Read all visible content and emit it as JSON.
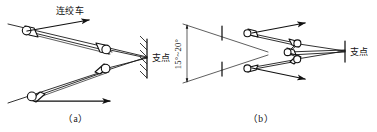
{
  "figure": {
    "background_color": "#ffffff",
    "line_color": "#1a1a1a",
    "width": 377,
    "height": 132
  },
  "labels": {
    "winch": "连绞车",
    "fulcrum_a": "支点",
    "fulcrum_b": "支点",
    "angle_range": "15°~20°",
    "caption_a": "（a）",
    "caption_b": "（b）"
  },
  "panel_a": {
    "name": "scheme-a",
    "caption": "（a）",
    "winch_label": "连绞车",
    "fulcrum_label": "支点",
    "rollers": [
      {
        "name": "roller-upper-left",
        "x": 27,
        "y": 31
      },
      {
        "name": "roller-upper-right",
        "x": 106,
        "y": 49
      },
      {
        "name": "roller-lower-right",
        "x": 105,
        "y": 69
      },
      {
        "name": "roller-lower-left",
        "x": 32,
        "y": 96
      }
    ],
    "arrows": [
      {
        "name": "arrow-winch-top",
        "direction": "right"
      },
      {
        "name": "arrow-bottom-pull",
        "direction": "right"
      }
    ]
  },
  "panel_b": {
    "name": "scheme-b",
    "caption": "（b）",
    "fulcrum_label": "支点",
    "angle_label": "15°~20°",
    "rollers": [
      {
        "name": "roller-b-upper-left",
        "x": 247,
        "y": 33
      },
      {
        "name": "roller-b-upper-right",
        "x": 297,
        "y": 43
      },
      {
        "name": "roller-b-mid",
        "x": 288,
        "y": 52
      },
      {
        "name": "roller-b-lower-right",
        "x": 297,
        "y": 59
      },
      {
        "name": "roller-b-lower-left",
        "x": 247,
        "y": 68
      }
    ],
    "arrows": [
      {
        "name": "arrow-b-top",
        "direction": "right"
      },
      {
        "name": "arrow-b-bottom",
        "direction": "right"
      }
    ],
    "tick_marks": [
      {
        "name": "tick-upper"
      },
      {
        "name": "tick-lower"
      }
    ]
  }
}
